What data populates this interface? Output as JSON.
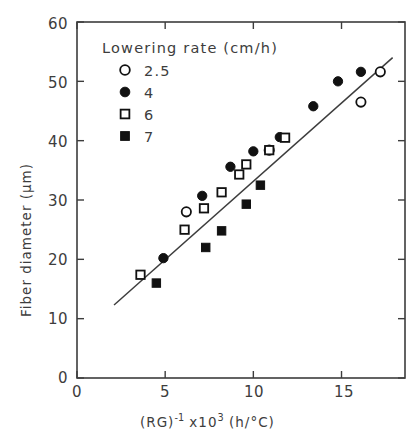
{
  "chart_data": {
    "type": "scatter",
    "title": "",
    "xlabel": "(RG)-1 x103 (h/°C)",
    "ylabel": "Fiber diameter (μm)",
    "xlim": [
      0,
      18.6
    ],
    "ylim": [
      0,
      60
    ],
    "xticks": [
      0,
      5,
      10,
      15
    ],
    "yticks": [
      0,
      10,
      20,
      30,
      40,
      50,
      60
    ],
    "grid": false,
    "legend_position": "upper-left-inside",
    "legend_title": "Lowering rate (cm/h)",
    "series": [
      {
        "name": "2.5",
        "marker": "open-circle",
        "points": [
          [
            6.2,
            28.0
          ],
          [
            10.9,
            38.4
          ],
          [
            16.1,
            46.5
          ],
          [
            17.2,
            51.6
          ]
        ]
      },
      {
        "name": "4",
        "marker": "filled-circle",
        "points": [
          [
            4.9,
            20.2
          ],
          [
            7.1,
            30.7
          ],
          [
            8.7,
            35.6
          ],
          [
            10.0,
            38.2
          ],
          [
            11.5,
            40.6
          ],
          [
            13.4,
            45.8
          ],
          [
            14.8,
            50.0
          ],
          [
            16.1,
            51.6
          ]
        ]
      },
      {
        "name": "6",
        "marker": "open-square",
        "points": [
          [
            3.6,
            17.4
          ],
          [
            6.1,
            25.0
          ],
          [
            7.2,
            28.6
          ],
          [
            8.2,
            31.3
          ],
          [
            9.2,
            34.3
          ],
          [
            9.6,
            36.0
          ],
          [
            10.9,
            38.4
          ],
          [
            11.8,
            40.5
          ]
        ]
      },
      {
        "name": "7",
        "marker": "filled-square",
        "points": [
          [
            4.5,
            16.0
          ],
          [
            7.3,
            22.0
          ],
          [
            8.2,
            24.8
          ],
          [
            9.6,
            29.3
          ],
          [
            10.4,
            32.5
          ]
        ]
      }
    ],
    "trend_line": {
      "x": [
        2.1,
        17.9
      ],
      "y": [
        12.3,
        54.0
      ]
    }
  },
  "axes": {
    "x_tick_labels": [
      "0",
      "5",
      "10",
      "15"
    ],
    "y_tick_labels": [
      "0",
      "10",
      "20",
      "30",
      "40",
      "50",
      "60"
    ],
    "x_title_parts": {
      "base": "(RG)",
      "exponent": "-1",
      "mantissa": " x10",
      "power": "3",
      "units": " (h/°C)"
    },
    "y_title": "Fiber diameter (μm)"
  },
  "legend": {
    "title": "Lowering rate (cm/h)",
    "items": [
      {
        "label": "2.5",
        "marker": "open-circle"
      },
      {
        "label": "4",
        "marker": "filled-circle"
      },
      {
        "label": "6",
        "marker": "open-square"
      },
      {
        "label": "7",
        "marker": "filled-square"
      }
    ]
  },
  "style": {
    "ink": "#3d3d3d",
    "marker_fill": "#111111",
    "background": "#ffffff"
  }
}
